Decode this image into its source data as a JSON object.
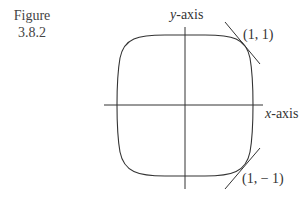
{
  "figure": {
    "caption_line1": "Figure",
    "caption_line2": "3.8.2",
    "x_axis_label_var": "x",
    "x_axis_label_suffix": "-axis",
    "y_axis_label_var": "y",
    "y_axis_label_suffix": "-axis",
    "point_upper": "(1, 1)",
    "point_lower": "(1, − 1)",
    "line_color": "#333333"
  },
  "diagram": {
    "points": [
      {
        "label": "(1, 1)",
        "x": 1,
        "y": 1
      },
      {
        "label": "(1, -1)",
        "x": 1,
        "y": -1
      }
    ]
  }
}
